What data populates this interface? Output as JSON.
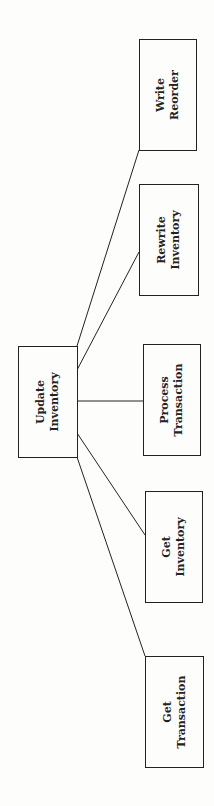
{
  "diagram": {
    "type": "structure-chart",
    "orientation": "rotated-90-ccw",
    "root": {
      "line1": "Update",
      "line2": "Inventory"
    },
    "children": [
      {
        "line1": "Write",
        "line2": "Reorder"
      },
      {
        "line1": "Rewrite",
        "line2": "Inventory"
      },
      {
        "line1": "Process",
        "line2": "Transaction"
      },
      {
        "line1": "Get",
        "line2": "Inventory"
      },
      {
        "line1": "Get",
        "line2": "Transaction"
      }
    ],
    "colors": {
      "line": "#222222",
      "background": "#fdfdfb"
    }
  }
}
